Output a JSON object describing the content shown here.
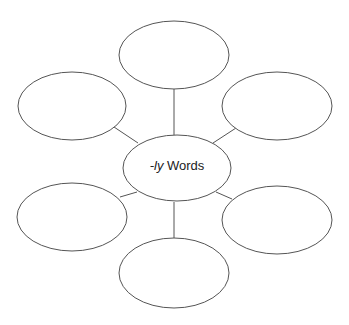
{
  "diagram": {
    "type": "word-web",
    "center": {
      "label_italic": "-ly",
      "label_rest": " Words"
    },
    "outer_nodes": [
      {
        "position": "top",
        "label": ""
      },
      {
        "position": "upper-left",
        "label": ""
      },
      {
        "position": "upper-right",
        "label": ""
      },
      {
        "position": "lower-left",
        "label": ""
      },
      {
        "position": "lower-right",
        "label": ""
      },
      {
        "position": "bottom",
        "label": ""
      }
    ],
    "stroke_color": "#555555"
  }
}
